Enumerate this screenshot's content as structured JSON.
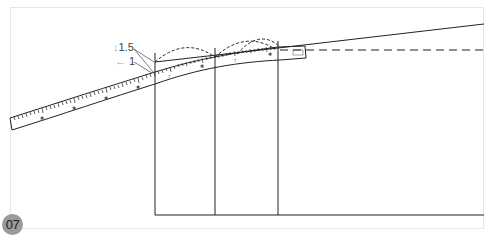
{
  "figure": {
    "number": "07",
    "labels": {
      "down_measure": "1.5",
      "left_measure": "1"
    },
    "icons": {
      "down_arrow": "↓",
      "left_arrow": "←"
    },
    "colors": {
      "line": "#222222",
      "ruler_fill": "#ffffff",
      "badge": "#9a9a9a",
      "frame": "#e6e6e6",
      "arrow": "#aaaaaa"
    }
  }
}
